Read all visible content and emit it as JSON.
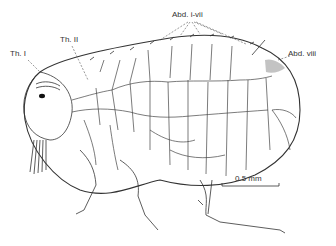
{
  "figure": {
    "labels": {
      "thorax_1": "Th. I",
      "thorax_2": "Th. II",
      "abdomen_1_7": "Abd. i-vii",
      "abdomen_8": "Abd. viii"
    },
    "scale_bar": {
      "label": "0.5 mm"
    }
  }
}
